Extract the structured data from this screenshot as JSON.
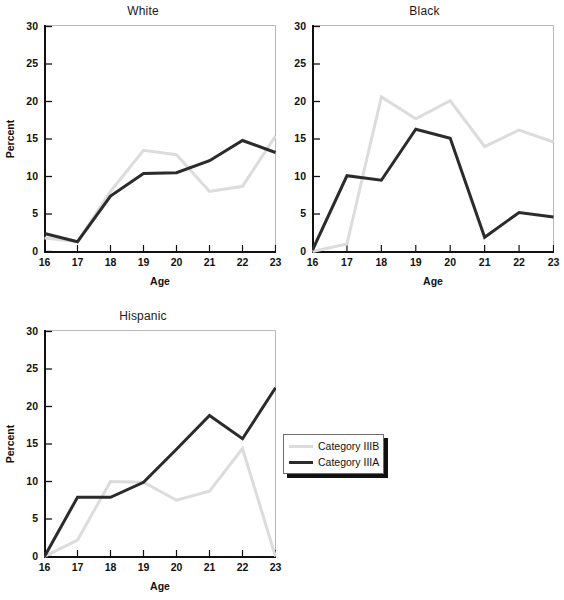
{
  "figure": {
    "background": "#ffffff",
    "width": 559,
    "height": 600
  },
  "legend": {
    "position": "middle-right",
    "entries": [
      {
        "label": "Category IIIB",
        "color": "#dcdcdc"
      },
      {
        "label": "Category IIIA",
        "color": "#2b2b2b"
      }
    ]
  },
  "axes_common": {
    "xlabel": "Age",
    "ylabel": "Percent",
    "xticks": [
      "16",
      "17",
      "18",
      "19",
      "20",
      "21",
      "22",
      "23"
    ],
    "yticks": [
      "0",
      "5",
      "10",
      "15",
      "20",
      "25",
      "30"
    ],
    "xlim": [
      16,
      23
    ],
    "ylim": [
      0,
      30
    ],
    "grid": false
  },
  "chart_data": [
    {
      "type": "line",
      "title": "White",
      "xlabel": "Age",
      "ylabel": "Percent",
      "x": [
        16,
        17,
        18,
        19,
        20,
        21,
        22,
        23
      ],
      "xlim": [
        16,
        23
      ],
      "ylim": [
        0,
        30
      ],
      "grid": false,
      "legend_position": "middle-right",
      "series": [
        {
          "name": "Category IIIB",
          "color": "#dcdcdc",
          "values": [
            1.8,
            1.3,
            8.0,
            13.5,
            12.9,
            8.0,
            8.7,
            15.4
          ]
        },
        {
          "name": "Category IIIA",
          "color": "#2b2b2b",
          "values": [
            2.4,
            1.3,
            7.4,
            10.4,
            10.5,
            12.1,
            14.8,
            13.2
          ]
        }
      ]
    },
    {
      "type": "line",
      "title": "Black",
      "xlabel": "Age",
      "ylabel": "Percent",
      "x": [
        16,
        17,
        18,
        19,
        20,
        21,
        22,
        23
      ],
      "xlim": [
        16,
        23
      ],
      "ylim": [
        0,
        30
      ],
      "grid": false,
      "legend_position": "middle-right",
      "series": [
        {
          "name": "Category IIIB",
          "color": "#dcdcdc",
          "values": [
            0.0,
            1.0,
            20.6,
            17.7,
            20.1,
            14.0,
            16.2,
            14.6
          ]
        },
        {
          "name": "Category IIIA",
          "color": "#2b2b2b",
          "values": [
            0.2,
            10.1,
            9.5,
            16.3,
            15.1,
            1.9,
            5.2,
            4.6
          ]
        }
      ]
    },
    {
      "type": "line",
      "title": "Hispanic",
      "xlabel": "Age",
      "ylabel": "Percent",
      "x": [
        16,
        17,
        18,
        19,
        20,
        21,
        22,
        23
      ],
      "xlim": [
        16,
        23
      ],
      "ylim": [
        0,
        30
      ],
      "grid": false,
      "legend_position": "middle-right",
      "series": [
        {
          "name": "Category IIIB",
          "color": "#dcdcdc",
          "values": [
            0.0,
            2.2,
            10.0,
            9.9,
            7.5,
            8.7,
            14.4,
            0.0
          ]
        },
        {
          "name": "Category IIIA",
          "color": "#2b2b2b",
          "values": [
            0.0,
            7.9,
            7.9,
            9.9,
            14.3,
            18.8,
            15.7,
            22.5
          ]
        }
      ]
    }
  ]
}
